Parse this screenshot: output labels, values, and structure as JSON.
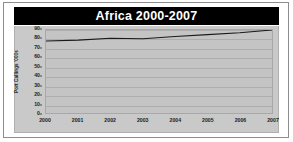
{
  "chart_data": {
    "type": "line",
    "title": "Africa 2000-2007",
    "xlabel": "",
    "ylabel": "Port Callings '000s",
    "categories": [
      "2000",
      "2001",
      "2002",
      "2003",
      "2004",
      "2005",
      "2006",
      "2007"
    ],
    "x": [
      2000,
      2001,
      2002,
      2003,
      2004,
      2005,
      2006,
      2007
    ],
    "values": [
      78,
      79,
      81,
      80.5,
      83,
      85,
      87,
      90
    ],
    "series": [
      {
        "name": "Port Callings",
        "values": [
          78,
          79,
          81,
          80.5,
          83,
          85,
          87,
          90
        ]
      }
    ],
    "ylim": [
      0,
      90
    ],
    "xlim": [
      2000,
      2007
    ],
    "y_ticks": [
      0,
      10,
      20,
      30,
      40,
      50,
      60,
      70,
      80,
      90
    ],
    "y_tick_labels": [
      "0",
      "10",
      "20",
      "30",
      "40",
      "50",
      "60",
      "70",
      "80",
      "90"
    ],
    "x_tick_labels": [
      "2000",
      "2001",
      "2002",
      "2003",
      "2004",
      "2005",
      "2006",
      "2007"
    ],
    "grid": true,
    "grid_axis": "y",
    "legend": false,
    "legend_position": "none",
    "colors": {
      "title_banner": "#000000",
      "title_text": "#ffffff",
      "panel_background": "#c9c9c9",
      "plot_background": "#c4c4c4",
      "gridline": "#aeaeae",
      "series_line": "#1a1a1a",
      "axis_text": "#1b1b1b",
      "frame_border": "#8d8d8d",
      "page_background": "#ffffff"
    }
  }
}
